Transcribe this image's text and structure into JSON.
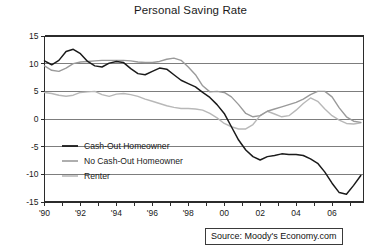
{
  "chart_data": {
    "type": "line",
    "title": "Personal Saving Rate",
    "xlabel": "",
    "ylabel": "",
    "xlim": [
      1990,
      2007.75
    ],
    "ylim": [
      -15,
      15
    ],
    "ytick_values": [
      15,
      10,
      5,
      0,
      -5,
      -10,
      -15
    ],
    "ytick_labels": [
      "15",
      "10",
      "5",
      "0",
      "-5",
      "-10",
      "-15"
    ],
    "xtick_values": [
      1990,
      1991,
      1992,
      1993,
      1994,
      1995,
      1996,
      1997,
      1998,
      1999,
      2000,
      2001,
      2002,
      2003,
      2004,
      2005,
      2006,
      2007
    ],
    "xtick_labels": [
      "'90",
      "",
      "'92",
      "",
      "'94",
      "",
      "'96",
      "",
      "'98",
      "",
      "00",
      "",
      "02",
      "",
      "04",
      "",
      "06",
      ""
    ],
    "grid": "horizontal",
    "legend_position": "lower-left-inside",
    "source": "Source: Moody's Economy.com",
    "series": [
      {
        "name": "Cash-Out Homeowner",
        "color": "#1a1a1a",
        "x": [
          1990.0,
          1990.4,
          1990.8,
          1991.2,
          1991.6,
          1992.0,
          1992.4,
          1992.8,
          1993.2,
          1993.6,
          1994.0,
          1994.4,
          1994.8,
          1995.2,
          1995.6,
          1996.0,
          1996.4,
          1996.8,
          1997.2,
          1997.6,
          1998.0,
          1998.4,
          1998.8,
          1999.2,
          1999.6,
          2000.0,
          2000.4,
          2000.8,
          2001.2,
          2001.6,
          2002.0,
          2002.4,
          2002.8,
          2003.2,
          2003.6,
          2004.0,
          2004.4,
          2004.8,
          2005.2,
          2005.6,
          2006.0,
          2006.4,
          2006.8,
          2007.2,
          2007.6
        ],
        "y": [
          10.5,
          9.8,
          10.6,
          12.2,
          12.6,
          11.8,
          10.4,
          9.6,
          9.4,
          10.1,
          10.4,
          10.2,
          9.1,
          8.2,
          8.0,
          8.6,
          9.2,
          9.0,
          8.0,
          7.0,
          6.4,
          5.8,
          4.8,
          3.9,
          2.6,
          1.0,
          -1.4,
          -3.8,
          -5.6,
          -6.8,
          -7.4,
          -6.8,
          -6.6,
          -6.3,
          -6.4,
          -6.4,
          -6.6,
          -7.2,
          -8.0,
          -9.6,
          -11.6,
          -13.3,
          -13.6,
          -12.0,
          -10.2
        ]
      },
      {
        "name": "No Cash-Out Homeowner",
        "color": "#9a9a9a",
        "x": [
          1990.0,
          1990.4,
          1990.8,
          1991.2,
          1991.6,
          1992.0,
          1992.4,
          1992.8,
          1993.2,
          1993.6,
          1994.0,
          1994.4,
          1994.8,
          1995.2,
          1995.6,
          1996.0,
          1996.4,
          1996.8,
          1997.2,
          1997.6,
          1998.0,
          1998.4,
          1998.8,
          1999.2,
          1999.6,
          2000.0,
          2000.4,
          2000.8,
          2001.2,
          2001.6,
          2002.0,
          2002.4,
          2002.8,
          2003.2,
          2003.6,
          2004.0,
          2004.4,
          2004.8,
          2005.2,
          2005.6,
          2006.0,
          2006.4,
          2006.8,
          2007.2,
          2007.6
        ],
        "y": [
          9.6,
          8.8,
          8.6,
          9.2,
          10.0,
          10.3,
          10.4,
          10.5,
          10.6,
          10.6,
          10.6,
          10.6,
          10.5,
          10.3,
          10.2,
          10.2,
          10.4,
          10.8,
          11.0,
          10.6,
          9.4,
          8.0,
          6.0,
          4.9,
          5.0,
          4.8,
          4.0,
          2.6,
          1.0,
          0.4,
          0.6,
          1.4,
          1.8,
          2.2,
          2.6,
          3.0,
          3.6,
          4.4,
          5.0,
          5.0,
          4.0,
          2.0,
          0.4,
          -0.4,
          -0.6
        ]
      },
      {
        "name": "Renter",
        "color": "#b8b8b8",
        "x": [
          1990.0,
          1990.4,
          1990.8,
          1991.2,
          1991.6,
          1992.0,
          1992.4,
          1992.8,
          1993.2,
          1993.6,
          1994.0,
          1994.4,
          1994.8,
          1995.2,
          1995.6,
          1996.0,
          1996.4,
          1996.8,
          1997.2,
          1997.6,
          1998.0,
          1998.4,
          1998.8,
          1999.2,
          1999.6,
          2000.0,
          2000.4,
          2000.8,
          2001.2,
          2001.6,
          2002.0,
          2002.4,
          2002.8,
          2003.2,
          2003.6,
          2004.0,
          2004.4,
          2004.8,
          2005.2,
          2005.6,
          2006.0,
          2006.4,
          2006.8,
          2007.2,
          2007.6
        ],
        "y": [
          4.8,
          4.6,
          4.3,
          4.1,
          4.3,
          4.8,
          4.9,
          5.0,
          4.4,
          4.1,
          4.5,
          4.6,
          4.4,
          4.1,
          3.6,
          3.2,
          2.8,
          2.4,
          2.1,
          1.9,
          1.9,
          1.8,
          1.6,
          1.0,
          0.2,
          -0.8,
          -1.4,
          -1.8,
          -1.8,
          -1.0,
          0.6,
          1.4,
          0.9,
          0.4,
          0.6,
          1.6,
          2.8,
          3.8,
          3.2,
          1.8,
          0.6,
          -0.2,
          -0.8,
          -0.9,
          -0.7
        ]
      }
    ]
  },
  "title": "Personal Saving Rate",
  "source_note": "Source: Moody's Economy.com"
}
